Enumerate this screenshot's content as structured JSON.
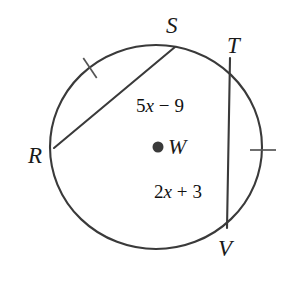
{
  "figure": {
    "type": "circle-with-two-chords",
    "background_color": "#ffffff",
    "stroke_color": "#3a3a3a",
    "text_color": "#1a1a1a",
    "circle": {
      "center_x": 156,
      "center_y": 147,
      "radius_x": 106,
      "radius_y": 102
    },
    "center_point": {
      "label": "W",
      "dot_x": 158,
      "dot_y": 147,
      "label_x": 168,
      "label_y": 154
    },
    "vertices": [
      {
        "label": "S",
        "point_x": 175,
        "point_y": 47,
        "label_x": 166,
        "label_y": 33
      },
      {
        "label": "T",
        "point_x": 230,
        "point_y": 58,
        "label_x": 227,
        "label_y": 53
      },
      {
        "label": "R",
        "point_x": 54,
        "point_y": 148,
        "label_x": 28,
        "label_y": 163
      },
      {
        "label": "V",
        "point_x": 227,
        "point_y": 228,
        "label_x": 218,
        "label_y": 256
      }
    ],
    "chords": [
      {
        "name": "RS",
        "x1": 54,
        "y1": 148,
        "x2": 175,
        "y2": 47,
        "measure": "5x − 9"
      },
      {
        "name": "TV",
        "x1": 230,
        "y1": 58,
        "x2": 227,
        "y2": 228,
        "measure": "2x + 3"
      }
    ],
    "chord_labels": [
      {
        "text": "5x − 9",
        "coefficient": "5",
        "variable": "x",
        "operator": "−",
        "constant": "9",
        "x": 160,
        "y": 112
      },
      {
        "text": "2x + 3",
        "coefficient": "2",
        "variable": "x",
        "operator": "+",
        "constant": "3",
        "x": 178,
        "y": 198
      }
    ],
    "congruence_ticks": [
      {
        "name": "tick-arc-RS",
        "cx": 90,
        "cy": 68,
        "angle_deg": 56,
        "length": 24
      },
      {
        "name": "tick-arc-TV",
        "cx": 263,
        "cy": 150,
        "angle_deg": 0,
        "length": 26
      }
    ]
  }
}
